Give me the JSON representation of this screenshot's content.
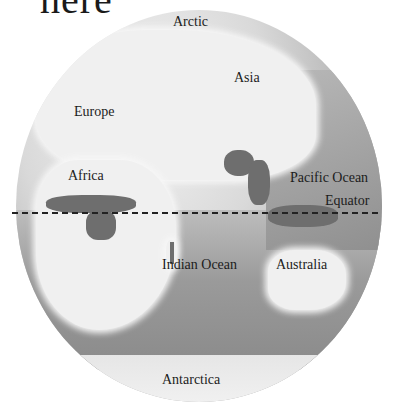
{
  "title_fragment": "here",
  "map": {
    "type": "globe",
    "style": "grayscale",
    "labels": {
      "arctic": "Arctic",
      "asia": "Asia",
      "europe": "Europe",
      "africa": "Africa",
      "pacific_ocean": "Pacific Ocean",
      "equator": "Equator",
      "indian_ocean": "Indian Ocean",
      "australia": "Australia",
      "antarctica": "Antarctica"
    },
    "colors": {
      "land": "#f0f0f0",
      "ocean": "#9a9a9a",
      "highlight_regions": "#6e6e6e",
      "equator_line": "#222222"
    },
    "highlighted_regions_note": "dark shaded tropical rainforest areas in Central Africa, India, Southeast Asia, Indonesia, Madagascar, New Guinea"
  }
}
